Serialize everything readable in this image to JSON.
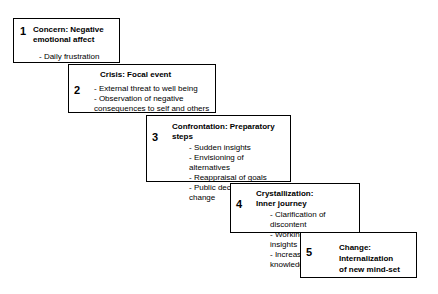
{
  "diagram": {
    "background_color": "#ffffff",
    "border_color": "#000000",
    "text_color": "#000000",
    "stages": [
      {
        "number": "1",
        "title": "Concern: Negative\nemotional affect",
        "items": [
          "- Daily frustration"
        ]
      },
      {
        "number": "2",
        "title": "Crisis: Focal event",
        "items": [
          "- External threat to well being",
          "- Observation of negative\nconsequences to self and others"
        ]
      },
      {
        "number": "3",
        "title": "Confrontation: Preparatory\nsteps",
        "items": [
          "- Sudden insights",
          "- Envisioning  of alternatives",
          "- Reappraisal of goals",
          "- Public declaration of change"
        ]
      },
      {
        "number": "4",
        "title": "Crystallization:\nInner journey",
        "items": [
          "- Clarification of discontent",
          "- Working through insights",
          "- Increased self knowledge"
        ]
      },
      {
        "number": "5",
        "title": "Change:\nInternalization\nof new mind-set",
        "items": []
      }
    ]
  }
}
